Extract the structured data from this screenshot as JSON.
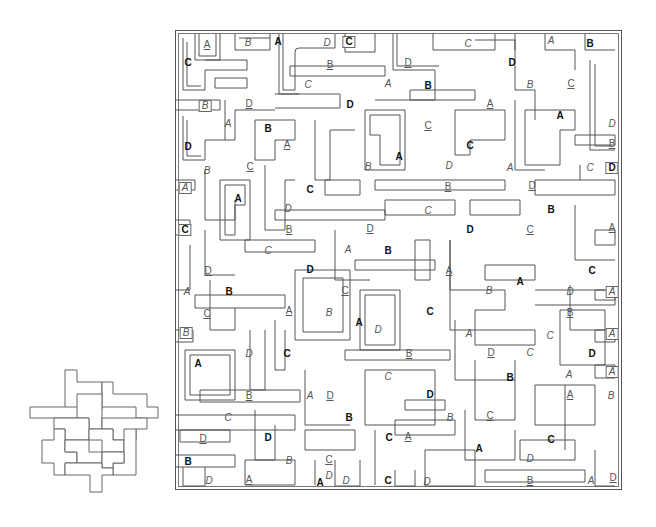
{
  "puzzle": {
    "type": "maze-shape-search",
    "legend_styles": [
      "bold",
      "italic",
      "underline",
      "boxed",
      "boxbold"
    ],
    "letters": [
      "A",
      "B",
      "C",
      "D"
    ],
    "maze_bounds": {
      "x": 175,
      "y": 30,
      "width": 447,
      "height": 460
    },
    "key_shape_bounds": {
      "x": 30,
      "y": 370,
      "width": 128,
      "height": 122
    },
    "labels": [
      {
        "t": "A",
        "s": "underline",
        "x": 207,
        "y": 45
      },
      {
        "t": "B",
        "s": "italic",
        "x": 248,
        "y": 43
      },
      {
        "t": "A",
        "s": "bold",
        "x": 278,
        "y": 42
      },
      {
        "t": "D",
        "s": "italic",
        "x": 327,
        "y": 43
      },
      {
        "t": "C",
        "s": "boxbold",
        "x": 349,
        "y": 42
      },
      {
        "t": "C",
        "s": "italic",
        "x": 468,
        "y": 44
      },
      {
        "t": "A",
        "s": "italic",
        "x": 551,
        "y": 41
      },
      {
        "t": "B",
        "s": "bold",
        "x": 590,
        "y": 44
      },
      {
        "t": "C",
        "s": "bold",
        "x": 188,
        "y": 63
      },
      {
        "t": "B",
        "s": "underline",
        "x": 330,
        "y": 65
      },
      {
        "t": "D",
        "s": "underline",
        "x": 408,
        "y": 63
      },
      {
        "t": "D",
        "s": "bold",
        "x": 512,
        "y": 63
      },
      {
        "t": "C",
        "s": "italic",
        "x": 308,
        "y": 85
      },
      {
        "t": "B",
        "s": "italic",
        "x": 530,
        "y": 85
      },
      {
        "t": "C",
        "s": "underline",
        "x": 571,
        "y": 84
      },
      {
        "t": "B",
        "s": "boxed",
        "x": 205,
        "y": 106
      },
      {
        "t": "D",
        "s": "underline",
        "x": 249,
        "y": 104
      },
      {
        "t": "D",
        "s": "bold",
        "x": 350,
        "y": 105
      },
      {
        "t": "A",
        "s": "italic",
        "x": 388,
        "y": 84
      },
      {
        "t": "B",
        "s": "bold",
        "x": 428,
        "y": 86
      },
      {
        "t": "A",
        "s": "underline",
        "x": 490,
        "y": 104
      },
      {
        "t": "A",
        "s": "bold",
        "x": 560,
        "y": 116
      },
      {
        "t": "A",
        "s": "italic",
        "x": 228,
        "y": 124
      },
      {
        "t": "B",
        "s": "bold",
        "x": 268,
        "y": 129
      },
      {
        "t": "C",
        "s": "underline",
        "x": 428,
        "y": 126
      },
      {
        "t": "D",
        "s": "italic",
        "x": 612,
        "y": 124
      },
      {
        "t": "D",
        "s": "bold",
        "x": 188,
        "y": 147
      },
      {
        "t": "A",
        "s": "underline",
        "x": 287,
        "y": 145
      },
      {
        "t": "C",
        "s": "bold",
        "x": 470,
        "y": 146
      },
      {
        "t": "B",
        "s": "underline",
        "x": 612,
        "y": 144
      },
      {
        "t": "B",
        "s": "italic",
        "x": 207,
        "y": 171
      },
      {
        "t": "C",
        "s": "underline",
        "x": 250,
        "y": 167
      },
      {
        "t": "A",
        "s": "bold",
        "x": 399,
        "y": 157
      },
      {
        "t": "B",
        "s": "italic",
        "x": 368,
        "y": 167
      },
      {
        "t": "D",
        "s": "italic",
        "x": 449,
        "y": 166
      },
      {
        "t": "A",
        "s": "italic",
        "x": 510,
        "y": 168
      },
      {
        "t": "C",
        "s": "italic",
        "x": 590,
        "y": 168
      },
      {
        "t": "D",
        "s": "boxbold",
        "x": 612,
        "y": 168
      },
      {
        "t": "A",
        "s": "boxed",
        "x": 185,
        "y": 188
      },
      {
        "t": "A",
        "s": "bold",
        "x": 238,
        "y": 199
      },
      {
        "t": "C",
        "s": "bold",
        "x": 310,
        "y": 190
      },
      {
        "t": "B",
        "s": "underline",
        "x": 448,
        "y": 187
      },
      {
        "t": "D",
        "s": "underline",
        "x": 532,
        "y": 186
      },
      {
        "t": "D",
        "s": "italic",
        "x": 288,
        "y": 209
      },
      {
        "t": "C",
        "s": "italic",
        "x": 428,
        "y": 211
      },
      {
        "t": "B",
        "s": "bold",
        "x": 551,
        "y": 210
      },
      {
        "t": "C",
        "s": "boxbold",
        "x": 185,
        "y": 230
      },
      {
        "t": "B",
        "s": "underline",
        "x": 289,
        "y": 230
      },
      {
        "t": "D",
        "s": "underline",
        "x": 370,
        "y": 229
      },
      {
        "t": "D",
        "s": "bold",
        "x": 470,
        "y": 230
      },
      {
        "t": "C",
        "s": "underline",
        "x": 530,
        "y": 230
      },
      {
        "t": "A",
        "s": "underline",
        "x": 612,
        "y": 228
      },
      {
        "t": "C",
        "s": "italic",
        "x": 268,
        "y": 251
      },
      {
        "t": "A",
        "s": "italic",
        "x": 348,
        "y": 250
      },
      {
        "t": "B",
        "s": "bold",
        "x": 388,
        "y": 251
      },
      {
        "t": "D",
        "s": "underline",
        "x": 208,
        "y": 271
      },
      {
        "t": "D",
        "s": "bold",
        "x": 310,
        "y": 270
      },
      {
        "t": "A",
        "s": "underline",
        "x": 449,
        "y": 271
      },
      {
        "t": "A",
        "s": "bold",
        "x": 520,
        "y": 282
      },
      {
        "t": "C",
        "s": "bold",
        "x": 592,
        "y": 271
      },
      {
        "t": "A",
        "s": "italic",
        "x": 187,
        "y": 292
      },
      {
        "t": "B",
        "s": "bold",
        "x": 229,
        "y": 292
      },
      {
        "t": "C",
        "s": "underline",
        "x": 345,
        "y": 291
      },
      {
        "t": "B",
        "s": "italic",
        "x": 489,
        "y": 291
      },
      {
        "t": "D",
        "s": "italic",
        "x": 570,
        "y": 292
      },
      {
        "t": "A",
        "s": "boxed",
        "x": 612,
        "y": 292
      },
      {
        "t": "C",
        "s": "underline",
        "x": 207,
        "y": 314
      },
      {
        "t": "A",
        "s": "underline",
        "x": 289,
        "y": 311
      },
      {
        "t": "B",
        "s": "italic",
        "x": 329,
        "y": 313
      },
      {
        "t": "A",
        "s": "bold",
        "x": 359,
        "y": 323
      },
      {
        "t": "C",
        "s": "bold",
        "x": 430,
        "y": 312
      },
      {
        "t": "B",
        "s": "underline",
        "x": 570,
        "y": 313
      },
      {
        "t": "B",
        "s": "boxed",
        "x": 186,
        "y": 333
      },
      {
        "t": "D",
        "s": "italic",
        "x": 378,
        "y": 330
      },
      {
        "t": "A",
        "s": "italic",
        "x": 469,
        "y": 334
      },
      {
        "t": "C",
        "s": "italic",
        "x": 550,
        "y": 336
      },
      {
        "t": "A",
        "s": "boxed",
        "x": 612,
        "y": 334
      },
      {
        "t": "A",
        "s": "bold",
        "x": 198,
        "y": 364
      },
      {
        "t": "D",
        "s": "italic",
        "x": 249,
        "y": 354
      },
      {
        "t": "C",
        "s": "bold",
        "x": 287,
        "y": 354
      },
      {
        "t": "B",
        "s": "underline",
        "x": 409,
        "y": 354
      },
      {
        "t": "D",
        "s": "underline",
        "x": 491,
        "y": 353
      },
      {
        "t": "C",
        "s": "italic",
        "x": 530,
        "y": 353
      },
      {
        "t": "D",
        "s": "bold",
        "x": 592,
        "y": 354
      },
      {
        "t": "A",
        "s": "boxed",
        "x": 612,
        "y": 372
      },
      {
        "t": "C",
        "s": "italic",
        "x": 388,
        "y": 377
      },
      {
        "t": "B",
        "s": "bold",
        "x": 510,
        "y": 378
      },
      {
        "t": "A",
        "s": "italic",
        "x": 569,
        "y": 375
      },
      {
        "t": "B",
        "s": "underline",
        "x": 249,
        "y": 396
      },
      {
        "t": "A",
        "s": "italic",
        "x": 310,
        "y": 396
      },
      {
        "t": "D",
        "s": "underline",
        "x": 330,
        "y": 396
      },
      {
        "t": "D",
        "s": "bold",
        "x": 430,
        "y": 395
      },
      {
        "t": "A",
        "s": "underline",
        "x": 570,
        "y": 395
      },
      {
        "t": "B",
        "s": "italic",
        "x": 611,
        "y": 396
      },
      {
        "t": "C",
        "s": "italic",
        "x": 228,
        "y": 418
      },
      {
        "t": "B",
        "s": "bold",
        "x": 349,
        "y": 418
      },
      {
        "t": "B",
        "s": "italic",
        "x": 450,
        "y": 418
      },
      {
        "t": "C",
        "s": "underline",
        "x": 490,
        "y": 416
      },
      {
        "t": "D",
        "s": "underline",
        "x": 203,
        "y": 439
      },
      {
        "t": "D",
        "s": "bold",
        "x": 268,
        "y": 438
      },
      {
        "t": "A",
        "s": "underline",
        "x": 408,
        "y": 437
      },
      {
        "t": "C",
        "s": "bold",
        "x": 389,
        "y": 438
      },
      {
        "t": "D",
        "s": "italic",
        "x": 329,
        "y": 476
      },
      {
        "t": "A",
        "s": "bold",
        "x": 479,
        "y": 449
      },
      {
        "t": "C",
        "s": "bold",
        "x": 551,
        "y": 440
      },
      {
        "t": "B",
        "s": "bold",
        "x": 188,
        "y": 462
      },
      {
        "t": "B",
        "s": "italic",
        "x": 289,
        "y": 461
      },
      {
        "t": "C",
        "s": "underline",
        "x": 329,
        "y": 460
      },
      {
        "t": "D",
        "s": "italic",
        "x": 530,
        "y": 459
      },
      {
        "t": "D",
        "s": "italic",
        "x": 209,
        "y": 481
      },
      {
        "t": "A",
        "s": "underline",
        "x": 249,
        "y": 480
      },
      {
        "t": "A",
        "s": "bold",
        "x": 320,
        "y": 483
      },
      {
        "t": "D",
        "s": "italic",
        "x": 346,
        "y": 481
      },
      {
        "t": "C",
        "s": "bold",
        "x": 388,
        "y": 481
      },
      {
        "t": "D",
        "s": "italic",
        "x": 427,
        "y": 482
      },
      {
        "t": "B",
        "s": "underline",
        "x": 530,
        "y": 481
      },
      {
        "t": "A",
        "s": "italic",
        "x": 591,
        "y": 481
      },
      {
        "t": "D",
        "s": "underline",
        "x": 613,
        "y": 478
      }
    ]
  }
}
